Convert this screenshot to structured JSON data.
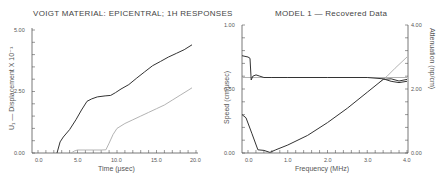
{
  "chart_data": [
    {
      "type": "line",
      "title": "VOIGT MATERIAL: EPICENTRAL; 1H RESPONSES",
      "xlabel": "Time (μsec)",
      "ylabel": "U₁ — Displacement X 10⁻¹",
      "xlim": [
        -1.0,
        20.0
      ],
      "ylim": [
        0.0,
        5.0
      ],
      "xticks": [
        "0.0",
        "5.0",
        "10.0",
        "15.0",
        "20.0"
      ],
      "yticks": [
        "0.00",
        "2.50",
        "5.00"
      ],
      "grid": false,
      "series": [
        {
          "name": "response-dark",
          "color": "#333333",
          "x": [
            2.4,
            2.8,
            3.2,
            4.0,
            4.8,
            5.5,
            6.2,
            6.8,
            7.5,
            8.5,
            9.2,
            9.8,
            10.5,
            11.5,
            12.5,
            13.5,
            14.5,
            15.5,
            16.5,
            17.5,
            18.5,
            19.5
          ],
          "y": [
            0.0,
            0.45,
            0.65,
            0.95,
            1.35,
            1.75,
            2.1,
            2.2,
            2.28,
            2.32,
            2.34,
            2.45,
            2.6,
            2.78,
            3.05,
            3.3,
            3.55,
            3.72,
            3.9,
            4.05,
            4.2,
            4.4
          ]
        },
        {
          "name": "response-light",
          "color": "#aaaaaa",
          "x": [
            4.2,
            4.6,
            5.0,
            6.0,
            7.0,
            8.0,
            8.6,
            9.0,
            9.5,
            10.0,
            11.0,
            12.0,
            13.0,
            14.0,
            15.0,
            16.0,
            17.0,
            18.0,
            19.0,
            19.5
          ],
          "y": [
            0.0,
            0.08,
            0.12,
            0.12,
            0.12,
            0.12,
            0.13,
            0.4,
            0.75,
            1.0,
            1.2,
            1.35,
            1.5,
            1.65,
            1.8,
            1.95,
            2.15,
            2.35,
            2.55,
            2.65
          ]
        }
      ]
    },
    {
      "type": "line",
      "title": "MODEL 1 — Recovered Data",
      "xlabel": "Frequency (MHz)",
      "ylabel": "Speed (cm/μsec)",
      "ylabel_right": "Attenuation (np/cm)",
      "xlim": [
        -0.15,
        4.0
      ],
      "ylim": [
        0.0,
        1.0
      ],
      "ylim_right": [
        0.0,
        4.0
      ],
      "xticks": [
        "0.0",
        "1.0",
        "2.0",
        "3.0",
        "4.0"
      ],
      "yticks": [
        "0.00",
        "0.50",
        "1.00"
      ],
      "yticks_right": [
        "0.00",
        "2.00",
        "4.00"
      ],
      "grid": false,
      "series": [
        {
          "name": "speed-recovered",
          "axis": "left",
          "color": "#333333",
          "x": [
            -0.15,
            0.0,
            0.05,
            0.08,
            0.12,
            0.2,
            0.3,
            0.4,
            0.6,
            1.0,
            2.0,
            3.0,
            3.4,
            3.6,
            3.8,
            4.0
          ],
          "y": [
            0.76,
            0.75,
            0.74,
            0.57,
            0.6,
            0.61,
            0.6,
            0.59,
            0.59,
            0.59,
            0.59,
            0.59,
            0.58,
            0.56,
            0.55,
            0.56
          ]
        },
        {
          "name": "speed-true",
          "axis": "left",
          "color": "#aaaaaa",
          "x": [
            -0.15,
            4.0
          ],
          "y": [
            0.59,
            0.59
          ]
        },
        {
          "name": "attenuation-recovered",
          "axis": "right",
          "color": "#333333",
          "x": [
            -0.15,
            -0.05,
            0.1,
            0.25,
            0.4,
            0.55,
            0.7,
            1.0,
            1.5,
            2.0,
            2.5,
            3.0,
            3.4,
            3.6,
            3.8,
            4.0
          ],
          "y": [
            1.2,
            1.1,
            0.6,
            0.1,
            0.08,
            0.02,
            0.1,
            0.25,
            0.55,
            0.95,
            1.4,
            1.9,
            2.3,
            2.32,
            2.25,
            2.3
          ]
        },
        {
          "name": "attenuation-true",
          "axis": "right",
          "color": "#aaaaaa",
          "x": [
            3.3,
            3.5,
            3.7,
            4.0
          ],
          "y": [
            2.2,
            2.4,
            2.65,
            3.0
          ]
        }
      ]
    }
  ],
  "left_panel": {
    "title": "VOIGT MATERIAL: EPICENTRAL; 1H RESPONSES",
    "xlabel": "Time (μsec)",
    "ylabel": "U₁ — Displacement X 10⁻¹",
    "xticks": [
      "0.0",
      "5.0",
      "10.0",
      "15.0",
      "20.0"
    ],
    "yticks": [
      "0.00",
      "2.50",
      "5.00"
    ]
  },
  "right_panel": {
    "title": "MODEL 1 — Recovered Data",
    "xlabel": "Frequency (MHz)",
    "ylabel_left": "Speed (cm/μsec)",
    "ylabel_right": "Attenuation (np/cm)",
    "xticks": [
      "0.0",
      "1.0",
      "2.0",
      "3.0",
      "4.0"
    ],
    "yticks_left": [
      "0.00",
      "0.50",
      "1.00"
    ],
    "yticks_right": [
      "0.00",
      "2.00",
      "4.00"
    ]
  },
  "colors": {
    "axis": "#555555",
    "dark_series": "#333333",
    "light_series": "#aaaaaa"
  }
}
